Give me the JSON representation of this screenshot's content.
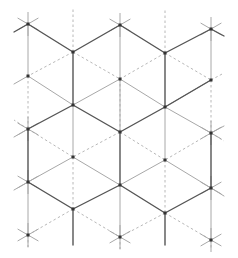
{
  "diagram": {
    "title": "",
    "colors": {
      "background": "#ffffff",
      "thick_edge": "#555555",
      "thin_edge": "#a8a8a8",
      "dashed_edge": "#b8b8b8",
      "vertex": "#333333"
    },
    "vertices": [
      [
        28,
        24
      ],
      [
        28,
        76
      ],
      [
        28,
        129
      ],
      [
        28,
        182
      ],
      [
        28,
        235
      ],
      [
        73,
        52
      ],
      [
        73,
        105
      ],
      [
        73,
        157
      ],
      [
        73,
        209
      ],
      [
        120,
        25
      ],
      [
        120,
        79
      ],
      [
        120,
        132
      ],
      [
        120,
        185
      ],
      [
        120,
        237
      ],
      [
        165,
        53
      ],
      [
        165,
        107
      ],
      [
        165,
        160
      ],
      [
        165,
        213
      ],
      [
        211,
        29
      ],
      [
        211,
        80
      ],
      [
        211,
        133
      ],
      [
        211,
        188
      ],
      [
        211,
        240
      ]
    ],
    "thick_edges": [
      [
        [
          28,
          24
        ],
        [
          73,
          52
        ]
      ],
      [
        [
          73,
          52
        ],
        [
          120,
          25
        ]
      ],
      [
        [
          120,
          25
        ],
        [
          165,
          53
        ]
      ],
      [
        [
          165,
          53
        ],
        [
          211,
          29
        ]
      ],
      [
        [
          73,
          52
        ],
        [
          73,
          105
        ]
      ],
      [
        [
          165,
          53
        ],
        [
          165,
          107
        ]
      ],
      [
        [
          28,
          129
        ],
        [
          73,
          105
        ]
      ],
      [
        [
          73,
          105
        ],
        [
          120,
          132
        ]
      ],
      [
        [
          120,
          132
        ],
        [
          165,
          107
        ]
      ],
      [
        [
          165,
          107
        ],
        [
          211,
          80
        ]
      ],
      [
        [
          28,
          129
        ],
        [
          28,
          182
        ]
      ],
      [
        [
          120,
          132
        ],
        [
          120,
          185
        ]
      ],
      [
        [
          211,
          133
        ],
        [
          211,
          188
        ]
      ],
      [
        [
          28,
          182
        ],
        [
          73,
          209
        ]
      ],
      [
        [
          73,
          209
        ],
        [
          120,
          185
        ]
      ],
      [
        [
          120,
          185
        ],
        [
          165,
          213
        ]
      ],
      [
        [
          165,
          213
        ],
        [
          211,
          188
        ]
      ],
      [
        [
          73,
          209
        ],
        [
          73,
          245
        ]
      ],
      [
        [
          165,
          213
        ],
        [
          165,
          245
        ]
      ],
      [
        [
          28,
          24
        ],
        [
          14,
          32
        ]
      ],
      [
        [
          211,
          29
        ],
        [
          224,
          36
        ]
      ]
    ],
    "thin_edges": [
      [
        [
          28,
          24
        ],
        [
          28,
          76
        ]
      ],
      [
        [
          120,
          25
        ],
        [
          120,
          79
        ]
      ],
      [
        [
          211,
          29
        ],
        [
          211,
          80
        ]
      ],
      [
        [
          28,
          76
        ],
        [
          73,
          105
        ]
      ],
      [
        [
          120,
          79
        ],
        [
          73,
          105
        ]
      ],
      [
        [
          120,
          79
        ],
        [
          165,
          107
        ]
      ],
      [
        [
          211,
          80
        ],
        [
          165,
          107
        ]
      ],
      [
        [
          28,
          76
        ],
        [
          14,
          84
        ]
      ],
      [
        [
          73,
          105
        ],
        [
          73,
          157
        ]
      ],
      [
        [
          165,
          107
        ],
        [
          165,
          160
        ]
      ],
      [
        [
          28,
          182
        ],
        [
          28,
          235
        ]
      ],
      [
        [
          120,
          185
        ],
        [
          120,
          237
        ]
      ],
      [
        [
          211,
          188
        ],
        [
          211,
          240
        ]
      ],
      [
        [
          73,
          157
        ],
        [
          28,
          182
        ]
      ],
      [
        [
          73,
          157
        ],
        [
          120,
          185
        ]
      ],
      [
        [
          165,
          160
        ],
        [
          120,
          185
        ]
      ],
      [
        [
          165,
          160
        ],
        [
          211,
          188
        ]
      ],
      [
        [
          211,
          133
        ],
        [
          165,
          107
        ]
      ],
      [
        [
          211,
          133
        ],
        [
          224,
          126
        ]
      ],
      [
        [
          28,
          129
        ],
        [
          14,
          137
        ]
      ],
      [
        [
          28,
          182
        ],
        [
          14,
          190
        ]
      ],
      [
        [
          211,
          188
        ],
        [
          224,
          196
        ]
      ],
      [
        [
          120,
          132
        ],
        [
          120,
          79
        ]
      ]
    ],
    "dashed_edges": [
      [
        [
          73,
          52
        ],
        [
          73,
          8
        ]
      ],
      [
        [
          165,
          53
        ],
        [
          165,
          8
        ]
      ],
      [
        [
          73,
          52
        ],
        [
          28,
          76
        ]
      ],
      [
        [
          73,
          52
        ],
        [
          120,
          79
        ]
      ],
      [
        [
          165,
          53
        ],
        [
          120,
          79
        ]
      ],
      [
        [
          165,
          53
        ],
        [
          211,
          80
        ]
      ],
      [
        [
          28,
          76
        ],
        [
          28,
          129
        ]
      ],
      [
        [
          120,
          79
        ],
        [
          120,
          132
        ]
      ],
      [
        [
          211,
          80
        ],
        [
          211,
          133
        ]
      ],
      [
        [
          28,
          129
        ],
        [
          73,
          157
        ]
      ],
      [
        [
          120,
          132
        ],
        [
          73,
          157
        ]
      ],
      [
        [
          120,
          132
        ],
        [
          165,
          160
        ]
      ],
      [
        [
          211,
          133
        ],
        [
          165,
          160
        ]
      ],
      [
        [
          73,
          157
        ],
        [
          73,
          209
        ]
      ],
      [
        [
          165,
          160
        ],
        [
          165,
          213
        ]
      ],
      [
        [
          73,
          209
        ],
        [
          28,
          235
        ]
      ],
      [
        [
          73,
          209
        ],
        [
          120,
          237
        ]
      ],
      [
        [
          165,
          213
        ],
        [
          120,
          237
        ]
      ],
      [
        [
          165,
          213
        ],
        [
          211,
          240
        ]
      ],
      [
        [
          28,
          235
        ],
        [
          28,
          250
        ]
      ],
      [
        [
          120,
          237
        ],
        [
          120,
          250
        ]
      ],
      [
        [
          211,
          240
        ],
        [
          211,
          250
        ]
      ],
      [
        [
          28,
          129
        ],
        [
          14,
          120
        ]
      ],
      [
        [
          211,
          133
        ],
        [
          224,
          141
        ]
      ],
      [
        [
          211,
          80
        ],
        [
          224,
          73
        ]
      ]
    ],
    "stars": [
      [
        28,
        24
      ],
      [
        120,
        25
      ],
      [
        211,
        29
      ],
      [
        28,
        182
      ],
      [
        28,
        235
      ],
      [
        120,
        237
      ],
      [
        211,
        240
      ],
      [
        211,
        188
      ],
      [
        211,
        133
      ],
      [
        28,
        129
      ]
    ]
  }
}
